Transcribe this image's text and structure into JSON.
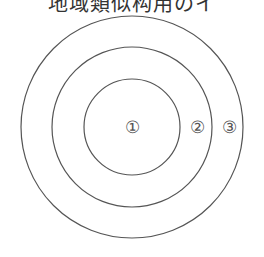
{
  "caption": "地域類似构用のイ",
  "diagram": {
    "type": "concentric-circles",
    "center": [
      132,
      127
    ],
    "circles": [
      {
        "id": "inner",
        "radius": 48
      },
      {
        "id": "middle",
        "radius": 80
      },
      {
        "id": "outer",
        "radius": 111
      }
    ],
    "labels": [
      {
        "text": "①",
        "x": 132,
        "y": 133
      },
      {
        "text": "②",
        "x": 197,
        "y": 133
      },
      {
        "text": "③",
        "x": 229,
        "y": 133
      }
    ],
    "stroke_color": "#555555"
  }
}
